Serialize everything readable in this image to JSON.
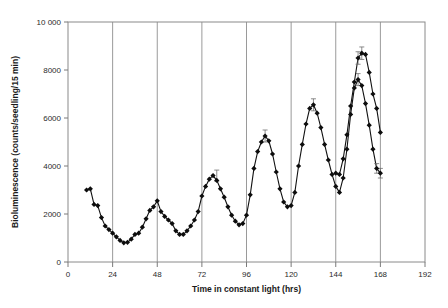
{
  "figure": {
    "title": "",
    "caption": ""
  },
  "axes": {
    "x_title": "Time in constant light (hrs)",
    "y_title": "Bioluminescence (counts/seedling/15 min)",
    "x_ticklabels": [
      "0",
      "24",
      "48",
      "72",
      "96",
      "120",
      "144",
      "168",
      "192"
    ],
    "y_ticklabels": [
      "0",
      "2000",
      "4000",
      "6000",
      "8000",
      "10 000"
    ]
  },
  "chart_data": {
    "type": "line",
    "title": "",
    "xlabel": "Time in constant light (hrs)",
    "ylabel": "Bioluminescence (counts/seedling/15 min)",
    "xlim": [
      0,
      192
    ],
    "ylim": [
      0,
      10000
    ],
    "xticks": [
      0,
      24,
      48,
      72,
      96,
      120,
      144,
      168,
      192
    ],
    "yticks": [
      0,
      2000,
      4000,
      6000,
      8000,
      10000
    ],
    "grid": "vertical-only",
    "legend": "none",
    "marker": "filled-diamond",
    "line_color": "#111111",
    "marker_color": "#0d0d0d",
    "series": [
      {
        "name": "Bioluminescence",
        "x": [
          10,
          12,
          14,
          16,
          18,
          20,
          22,
          24,
          26,
          28,
          30,
          32,
          34,
          36,
          38,
          40,
          42,
          44,
          46,
          48,
          50,
          52,
          54,
          56,
          58,
          60,
          62,
          64,
          66,
          68,
          70,
          72,
          74,
          76,
          78,
          80,
          82,
          84,
          86,
          88,
          90,
          92,
          94,
          96,
          98,
          100,
          102,
          104,
          106,
          108,
          110,
          112,
          114,
          116,
          118,
          120,
          122,
          124,
          126,
          128,
          130,
          132,
          134,
          136,
          138,
          140,
          142,
          144,
          146,
          148,
          150,
          152,
          154,
          156,
          158,
          160,
          162,
          164,
          166,
          168
        ],
        "y": [
          3000,
          3050,
          2400,
          2350,
          1850,
          1500,
          1350,
          1200,
          1050,
          900,
          800,
          820,
          950,
          1150,
          1200,
          1450,
          1800,
          2150,
          2300,
          2550,
          2100,
          1900,
          1750,
          1600,
          1300,
          1150,
          1150,
          1300,
          1500,
          1750,
          2100,
          2750,
          3150,
          3450,
          3600,
          3400,
          3050,
          2700,
          2300,
          1950,
          1700,
          1550,
          1600,
          1950,
          2800,
          3900,
          4600,
          5000,
          5250,
          5050,
          4500,
          3750,
          3050,
          2500,
          2300,
          2350,
          2900,
          4000,
          4900,
          5750,
          6400,
          6550,
          6200,
          5600,
          4900,
          4250,
          3650,
          3150,
          2900,
          3500,
          4700,
          6150,
          7250,
          7600,
          7350,
          6600,
          5700,
          4700,
          3900,
          3700
        ],
        "error_points": [
          {
            "x": 80,
            "y": 3600,
            "err": 230
          },
          {
            "x": 106,
            "y": 5250,
            "err": 250
          },
          {
            "x": 132,
            "y": 6550,
            "err": 250
          },
          {
            "x": 156,
            "y": 7600,
            "err": 250
          },
          {
            "x": 166,
            "y": 3900,
            "err": 200
          },
          {
            "x": 168,
            "y": 3700,
            "err": 200
          }
        ]
      },
      {
        "name": "Bioluminescence-continued",
        "x": [
          144,
          146,
          148,
          150,
          152,
          154,
          156,
          158,
          160,
          162,
          164,
          166,
          168
        ],
        "y": [
          3700,
          3650,
          4300,
          5300,
          6500,
          7500,
          8500,
          8700,
          8650,
          7900,
          7000,
          6400,
          5400
        ],
        "error_points": [
          {
            "x": 156,
            "y": 8500,
            "err": 260
          },
          {
            "x": 158,
            "y": 8700,
            "err": 260
          }
        ]
      }
    ]
  }
}
